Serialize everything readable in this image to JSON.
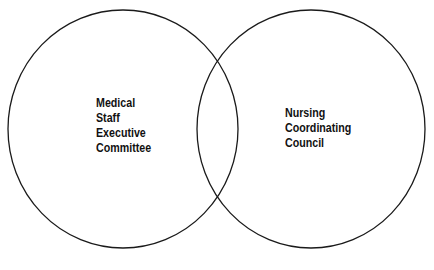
{
  "diagram": {
    "type": "venn",
    "circles": [
      {
        "id": "left",
        "label_lines": [
          "Medical",
          "Staff",
          "Executive",
          "Committee"
        ],
        "cx": 123,
        "cy": 129,
        "rx": 115,
        "ry": 119
      },
      {
        "id": "right",
        "label_lines": [
          "Nursing",
          "Coordinating",
          "Council"
        ],
        "cx": 311,
        "cy": 129,
        "rx": 114,
        "ry": 119
      }
    ],
    "stroke_color": "#1a1a1a",
    "background": "#ffffff"
  }
}
